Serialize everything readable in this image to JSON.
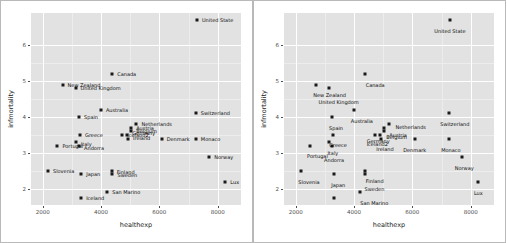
{
  "figure": {
    "type": "scatter-comparison",
    "panel_count": 2,
    "background": "#ffffff",
    "panel_background": "#e2e2e2",
    "gridline_color": "#ffffff",
    "point_color": "#1a1a1a"
  },
  "chart_data": {
    "type": "scatter",
    "title": "",
    "xlabel": "healthexp",
    "ylabel": "infmortality",
    "xlim": [
      1600,
      8800
    ],
    "ylim": [
      1.55,
      6.9
    ],
    "xticks": [
      2000,
      4000,
      6000,
      8000
    ],
    "yticks": [
      2,
      3,
      4,
      5,
      6
    ],
    "xtick_labels": [
      "2000",
      "4000",
      "6000",
      "8000"
    ],
    "ytick_labels": [
      "2",
      "3",
      "4",
      "5",
      "6"
    ],
    "grid": true,
    "legend": "none",
    "point_label_field": "country",
    "points": [
      {
        "country": "United State",
        "healthexp": 7290,
        "infmortality": 6.7
      },
      {
        "country": "Canada",
        "healthexp": 4383,
        "infmortality": 5.2
      },
      {
        "country": "New Zealand",
        "healthexp": 2683,
        "infmortality": 4.9
      },
      {
        "country": "United Kingdom",
        "healthexp": 3129,
        "infmortality": 4.8
      },
      {
        "country": "Australia",
        "healthexp": 3996,
        "infmortality": 4.2
      },
      {
        "country": "Switzerland",
        "healthexp": 7252,
        "infmortality": 4.1
      },
      {
        "country": "Spain",
        "healthexp": 3248,
        "infmortality": 4.0
      },
      {
        "country": "Netherlands",
        "healthexp": 5217,
        "infmortality": 3.8
      },
      {
        "country": "Austria",
        "healthexp": 5036,
        "infmortality": 3.7
      },
      {
        "country": "Belgium",
        "healthexp": 5040,
        "infmortality": 3.6
      },
      {
        "country": "Germany",
        "healthexp": 4900,
        "infmortality": 3.5
      },
      {
        "country": "Greece",
        "healthexp": 3282,
        "infmortality": 3.5
      },
      {
        "country": "Iceland2",
        "healthexp": 4730,
        "infmortality": 3.5
      },
      {
        "country": "Ireland",
        "healthexp": 4925,
        "infmortality": 3.4
      },
      {
        "country": "Denmark",
        "healthexp": 6081,
        "infmortality": 3.4
      },
      {
        "country": "Monaco",
        "healthexp": 7252,
        "infmortality": 3.4
      },
      {
        "country": "Portugal",
        "healthexp": 2508,
        "infmortality": 3.2
      },
      {
        "country": "Italy",
        "healthexp": 3137,
        "infmortality": 3.3
      },
      {
        "country": "Andorra",
        "healthexp": 3248,
        "infmortality": 3.2
      },
      {
        "country": "Norway",
        "healthexp": 7711,
        "infmortality": 2.9
      },
      {
        "country": "Slovenia",
        "healthexp": 2183,
        "infmortality": 2.5
      },
      {
        "country": "Japan",
        "healthexp": 3321,
        "infmortality": 2.4
      },
      {
        "country": "Finland",
        "healthexp": 4370,
        "infmortality": 2.5
      },
      {
        "country": "Sweden",
        "healthexp": 4394,
        "infmortality": 2.4
      },
      {
        "country": "Lux",
        "healthexp": 8262,
        "infmortality": 2.2
      },
      {
        "country": "San Marino",
        "healthexp": 4214,
        "infmortality": 1.9
      },
      {
        "country": "Iceland",
        "healthexp": 3319,
        "infmortality": 1.75
      }
    ]
  },
  "panels": [
    {
      "name": "left-panel",
      "label_mode": "overlapping",
      "axis_title_x": "healthexp",
      "axis_title_y": "infmortality",
      "labels": [
        {
          "country": "United State",
          "x": 7290,
          "y": 6.7,
          "anchor": "left",
          "dx": 5,
          "dy": 0
        },
        {
          "country": "Canada",
          "x": 4383,
          "y": 5.2,
          "anchor": "left",
          "dx": 5,
          "dy": 0
        },
        {
          "country": "New Zealand",
          "x": 2683,
          "y": 4.9,
          "anchor": "left",
          "dx": 5,
          "dy": 0
        },
        {
          "country": "United Kingdom",
          "x": 3129,
          "y": 4.8,
          "anchor": "left",
          "dx": 5,
          "dy": 0
        },
        {
          "country": "Australia",
          "x": 3996,
          "y": 4.2,
          "anchor": "left",
          "dx": 5,
          "dy": 0
        },
        {
          "country": "Switzerland",
          "x": 7252,
          "y": 4.1,
          "anchor": "left",
          "dx": 5,
          "dy": 0
        },
        {
          "country": "Spain",
          "x": 3248,
          "y": 4.0,
          "anchor": "left",
          "dx": 5,
          "dy": 0
        },
        {
          "country": "Netherlands",
          "x": 5217,
          "y": 3.8,
          "anchor": "left",
          "dx": 5,
          "dy": 0
        },
        {
          "country": "Austria",
          "x": 5036,
          "y": 3.7,
          "anchor": "left",
          "dx": 5,
          "dy": 0
        },
        {
          "country": "Belgium",
          "x": 5040,
          "y": 3.6,
          "anchor": "left",
          "dx": 5,
          "dy": 0
        },
        {
          "country": "Germany",
          "x": 4900,
          "y": 3.55,
          "anchor": "left",
          "dx": 5,
          "dy": 0
        },
        {
          "country": "Greece",
          "x": 3282,
          "y": 3.5,
          "anchor": "left",
          "dx": 5,
          "dy": 0
        },
        {
          "country": "Iceland2",
          "x": 4730,
          "y": 3.5,
          "anchor": "left",
          "dx": 5,
          "dy": 0
        },
        {
          "country": "Ireland",
          "x": 4925,
          "y": 3.42,
          "anchor": "left",
          "dx": 5,
          "dy": 0
        },
        {
          "country": "Denmark",
          "x": 6081,
          "y": 3.4,
          "anchor": "left",
          "dx": 5,
          "dy": 0
        },
        {
          "country": "Monaco",
          "x": 7252,
          "y": 3.4,
          "anchor": "left",
          "dx": 5,
          "dy": 0
        },
        {
          "country": "Portugal",
          "x": 2508,
          "y": 3.2,
          "anchor": "left",
          "dx": 5,
          "dy": 0
        },
        {
          "country": "Italy",
          "x": 3137,
          "y": 3.25,
          "anchor": "left",
          "dx": 5,
          "dy": 0
        },
        {
          "country": "Andorra",
          "x": 3248,
          "y": 3.15,
          "anchor": "left",
          "dx": 5,
          "dy": 0
        },
        {
          "country": "Norway",
          "x": 7711,
          "y": 2.9,
          "anchor": "left",
          "dx": 5,
          "dy": 0
        },
        {
          "country": "Slovenia",
          "x": 2183,
          "y": 2.5,
          "anchor": "left",
          "dx": 5,
          "dy": 0
        },
        {
          "country": "Japan",
          "x": 3321,
          "y": 2.4,
          "anchor": "left",
          "dx": 5,
          "dy": 0
        },
        {
          "country": "Finland",
          "x": 4370,
          "y": 2.48,
          "anchor": "left",
          "dx": 5,
          "dy": 0
        },
        {
          "country": "Sweden",
          "x": 4394,
          "y": 2.38,
          "anchor": "left",
          "dx": 5,
          "dy": 0
        },
        {
          "country": "Lux",
          "x": 8262,
          "y": 2.2,
          "anchor": "left",
          "dx": 5,
          "dy": 0
        },
        {
          "country": "San Marino",
          "x": 4214,
          "y": 1.9,
          "anchor": "left",
          "dx": 5,
          "dy": 0
        },
        {
          "country": "Iceland",
          "x": 3319,
          "y": 1.75,
          "anchor": "left",
          "dx": 5,
          "dy": 0
        }
      ]
    },
    {
      "name": "right-panel",
      "label_mode": "repelled",
      "axis_title_x": "healthexp",
      "axis_title_y": "infmortality",
      "labels": [
        {
          "country": "United State",
          "x": 7290,
          "y": 6.7,
          "anchor": "center",
          "dx": 0,
          "dy": 11
        },
        {
          "country": "Canada",
          "x": 4383,
          "y": 5.2,
          "anchor": "center",
          "dx": 10,
          "dy": 11
        },
        {
          "country": "New Zealand",
          "x": 2683,
          "y": 4.9,
          "anchor": "center",
          "dx": 14,
          "dy": 10
        },
        {
          "country": "United Kingdom",
          "x": 3129,
          "y": 4.8,
          "anchor": "center",
          "dx": 10,
          "dy": 14
        },
        {
          "country": "Australia",
          "x": 3996,
          "y": 4.2,
          "anchor": "center",
          "dx": 8,
          "dy": 11
        },
        {
          "country": "Switzerland",
          "x": 7252,
          "y": 4.1,
          "anchor": "center",
          "dx": 6,
          "dy": 11
        },
        {
          "country": "Spain",
          "x": 3248,
          "y": 4.0,
          "anchor": "center",
          "dx": 4,
          "dy": 11
        },
        {
          "country": "Netherlands",
          "x": 5217,
          "y": 3.8,
          "anchor": "left",
          "dx": 6,
          "dy": 3
        },
        {
          "country": "Austria",
          "x": 5036,
          "y": 3.7,
          "anchor": "left",
          "dx": 5,
          "dy": 7
        },
        {
          "country": "Belgium",
          "x": 5040,
          "y": 3.6,
          "anchor": "left",
          "dx": 2,
          "dy": 6
        },
        {
          "country": "Germany",
          "x": 4900,
          "y": 3.55,
          "anchor": "center",
          "dx": -2,
          "dy": 8
        },
        {
          "country": "Greece",
          "x": 3282,
          "y": 3.5,
          "anchor": "center",
          "dx": 5,
          "dy": 10
        },
        {
          "country": "Iceland2",
          "x": 4730,
          "y": 3.5,
          "anchor": "center",
          "dx": 2,
          "dy": 9
        },
        {
          "country": "Ireland",
          "x": 4925,
          "y": 3.42,
          "anchor": "center",
          "dx": 4,
          "dy": 11
        },
        {
          "country": "Denmark",
          "x": 6081,
          "y": 3.4,
          "anchor": "center",
          "dx": 0,
          "dy": 11
        },
        {
          "country": "Monaco",
          "x": 7252,
          "y": 3.4,
          "anchor": "center",
          "dx": 2,
          "dy": 11
        },
        {
          "country": "Portugal",
          "x": 2508,
          "y": 3.2,
          "anchor": "center",
          "dx": 7,
          "dy": 10
        },
        {
          "country": "Italy",
          "x": 3137,
          "y": 3.25,
          "anchor": "center",
          "dx": 4,
          "dy": 9
        },
        {
          "country": "Andorra",
          "x": 3248,
          "y": 3.15,
          "anchor": "center",
          "dx": 2,
          "dy": 12
        },
        {
          "country": "Norway",
          "x": 7711,
          "y": 2.9,
          "anchor": "center",
          "dx": 2,
          "dy": 11
        },
        {
          "country": "Slovenia",
          "x": 2183,
          "y": 2.5,
          "anchor": "center",
          "dx": 8,
          "dy": 11
        },
        {
          "country": "Japan",
          "x": 3321,
          "y": 2.4,
          "anchor": "center",
          "dx": 4,
          "dy": 11
        },
        {
          "country": "Finland",
          "x": 4370,
          "y": 2.48,
          "anchor": "center",
          "dx": 10,
          "dy": 9
        },
        {
          "country": "Sweden",
          "x": 4394,
          "y": 2.38,
          "anchor": "center",
          "dx": 9,
          "dy": 14
        },
        {
          "country": "Lux",
          "x": 8262,
          "y": 2.2,
          "anchor": "center",
          "dx": 0,
          "dy": 11
        },
        {
          "country": "San Marino",
          "x": 4214,
          "y": 1.9,
          "anchor": "center",
          "dx": 14,
          "dy": 11
        },
        {
          "country": "Iceland",
          "x": 3319,
          "y": 1.75,
          "anchor": "center",
          "dx": 6,
          "dy": 12
        }
      ]
    }
  ]
}
